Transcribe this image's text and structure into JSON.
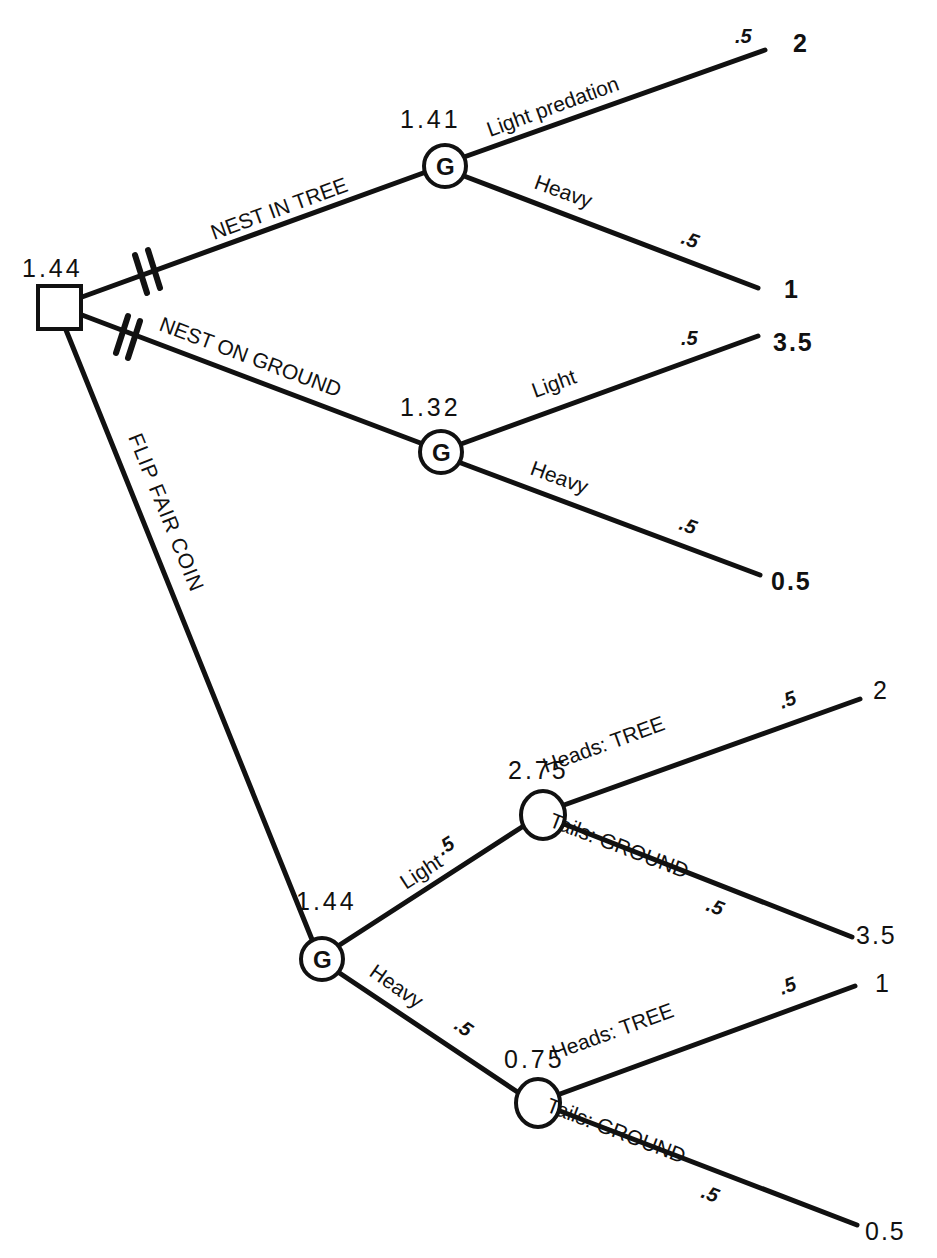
{
  "root": {
    "value": "1.44"
  },
  "branches": {
    "tree": {
      "label": "NEST IN TREE"
    },
    "ground": {
      "label": "NEST ON GROUND"
    },
    "coin": {
      "label": "FLIP  FAIR  COIN"
    }
  },
  "tree_node": {
    "value": "1.41",
    "glyph": "G",
    "light": {
      "label": "Light  predation",
      "prob": ".5",
      "payoff": "2"
    },
    "heavy": {
      "label": "Heavy",
      "prob": ".5",
      "payoff": "1"
    }
  },
  "ground_node": {
    "value": "1.32",
    "glyph": "G",
    "light": {
      "label": "Light",
      "prob": ".5",
      "payoff": "3.5"
    },
    "heavy": {
      "label": "Heavy",
      "prob": ".5",
      "payoff": "0.5"
    }
  },
  "coin_node": {
    "value": "1.44",
    "glyph": "G",
    "light": {
      "label": "Light",
      "prob": ".5"
    },
    "heavy": {
      "label": "Heavy",
      "prob": ".5"
    }
  },
  "light_chance": {
    "value": "2.75",
    "heads": {
      "label": "Heads:  TREE",
      "prob": ".5",
      "payoff": "2"
    },
    "tails": {
      "label": "Tails:  GROUND",
      "prob": ".5",
      "payoff": "3.5"
    }
  },
  "heavy_chance": {
    "value": "0.75",
    "heads": {
      "label": "Heads:  TREE",
      "prob": ".5",
      "payoff": "1"
    },
    "tails": {
      "label": "Tails:  GROUND",
      "prob": ".5",
      "payoff": "0.5"
    }
  }
}
